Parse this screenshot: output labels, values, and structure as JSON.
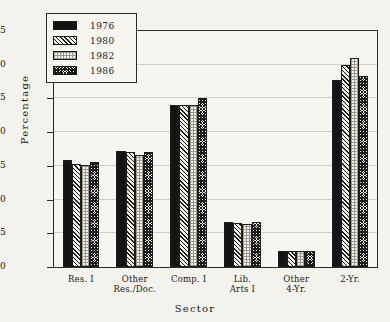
{
  "chart_data": {
    "type": "bar",
    "title": "",
    "xlabel": "Sector",
    "ylabel": "Percentage",
    "ylim": [
      0,
      35
    ],
    "yticks": [
      0,
      5,
      10,
      15,
      20,
      25,
      30,
      35
    ],
    "grid": true,
    "legend_position": "top-left",
    "categories": [
      "Res. I",
      "Other Res./Doc.",
      "Comp. I",
      "Lib. Arts I",
      "Other 4-Yr.",
      "2-Yr."
    ],
    "category_lines": [
      [
        "Res. I",
        ""
      ],
      [
        "Other",
        "Res./Doc."
      ],
      [
        "Comp. I",
        ""
      ],
      [
        "Lib.",
        "Arts I"
      ],
      [
        "Other",
        "4-Yr."
      ],
      [
        "2-Yr.",
        ""
      ]
    ],
    "series": [
      {
        "name": "1976",
        "pattern": "solid-black",
        "values": [
          15.8,
          17.2,
          24.0,
          6.7,
          2.4,
          27.8
        ]
      },
      {
        "name": "1980",
        "pattern": "diagonal-hatch",
        "values": [
          15.3,
          17.0,
          24.0,
          6.6,
          2.4,
          30.0
        ]
      },
      {
        "name": "1982",
        "pattern": "light-dots",
        "values": [
          15.2,
          16.6,
          24.0,
          6.4,
          2.4,
          31.0
        ]
      },
      {
        "name": "1986",
        "pattern": "dense-crosshatch",
        "values": [
          15.6,
          17.0,
          25.0,
          6.7,
          2.4,
          28.4
        ]
      }
    ]
  },
  "legend": {
    "items": [
      {
        "label": "1976",
        "pattern": "solid-black"
      },
      {
        "label": "1980",
        "pattern": "diagonal-hatch"
      },
      {
        "label": "1982",
        "pattern": "light-dots"
      },
      {
        "label": "1986",
        "pattern": "dense-crosshatch"
      }
    ]
  },
  "colors": {
    "background": "#f4f2ec",
    "plot_background": "#f7f5ef",
    "axis": "#2b2b2b",
    "grid": "#cfcdc4",
    "series_1976": "#141414",
    "series_1980": "#1c1c1c",
    "series_1982": "#9a968c",
    "series_1986": "#1c1c1c"
  }
}
